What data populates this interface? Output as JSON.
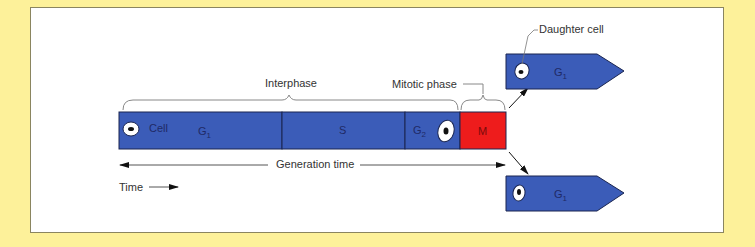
{
  "diagram": {
    "title_labels": {
      "interphase": "Interphase",
      "mitotic_phase": "Mitotic phase",
      "daughter_cell": "Daughter cell",
      "cell": "Cell",
      "generation_time": "Generation time",
      "time": "Time"
    },
    "phases": [
      {
        "name": "G",
        "sub": "1",
        "color": "#3b5cb8"
      },
      {
        "name": "S",
        "sub": "",
        "color": "#3b5cb8"
      },
      {
        "name": "G",
        "sub": "2",
        "color": "#3b5cb8"
      },
      {
        "name": "M",
        "sub": "",
        "color": "#ee1c1c"
      }
    ],
    "daughters": [
      {
        "name": "G",
        "sub": "1",
        "position": "top"
      },
      {
        "name": "G",
        "sub": "1",
        "position": "bottom"
      }
    ],
    "colors": {
      "background": "#fdf19a",
      "panel": "#ffffff",
      "interphase_blue": "#3b5cb8",
      "mitosis_red": "#ee1c1c",
      "outline": "#1a2550"
    }
  }
}
